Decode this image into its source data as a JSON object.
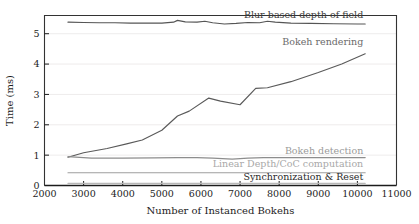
{
  "chart_data": {
    "type": "line",
    "title": "",
    "xlabel": "Number of Instanced Bokehs",
    "ylabel": "Time (ms)",
    "xlim": [
      2000,
      11000
    ],
    "ylim": [
      0,
      5.6
    ],
    "xticks": [
      2000,
      3000,
      4000,
      5000,
      6000,
      7000,
      8000,
      9000,
      10000,
      11000
    ],
    "xtick_labels": [
      "2000",
      "3000",
      "4000",
      "5000",
      "6000",
      "7000",
      "8000",
      "9000",
      "10000",
      "11000"
    ],
    "yticks": [
      0,
      1,
      2,
      3,
      4,
      5
    ],
    "ytick_labels": [
      "0",
      "1",
      "2",
      "3",
      "4",
      "5"
    ],
    "grid": "horizontal-faint",
    "legend_position": "inline-right-of-series",
    "series": [
      {
        "name": "Blur-based depth of field",
        "color": "#555555",
        "label_color": "#3a3a3a",
        "x": [
          2600,
          3000,
          3400,
          3800,
          4200,
          4600,
          5000,
          5300,
          5400,
          5600,
          5900,
          6100,
          6300,
          6600,
          6900,
          7200,
          7500,
          7700,
          7900,
          8300,
          8800,
          9400,
          10000,
          10200
        ],
        "y": [
          5.38,
          5.37,
          5.36,
          5.36,
          5.35,
          5.35,
          5.35,
          5.38,
          5.44,
          5.39,
          5.38,
          5.41,
          5.36,
          5.32,
          5.34,
          5.37,
          5.36,
          5.41,
          5.38,
          5.35,
          5.34,
          5.33,
          5.32,
          5.32
        ]
      },
      {
        "name": "Bokeh rendering",
        "color": "#5a5a5a",
        "label_color": "#6a6a6a",
        "x": [
          2600,
          3000,
          3600,
          4100,
          4500,
          5000,
          5400,
          5700,
          6200,
          6500,
          7000,
          7400,
          7700,
          8300,
          9000,
          9600,
          10200
        ],
        "y": [
          0.93,
          1.08,
          1.22,
          1.37,
          1.5,
          1.82,
          2.29,
          2.45,
          2.88,
          2.78,
          2.66,
          3.2,
          3.22,
          3.42,
          3.72,
          4.0,
          4.34
        ]
      },
      {
        "name": "Bokeh detection",
        "color": "#8d8d8d",
        "label_color": "#9a9a9a",
        "x": [
          2600,
          3200,
          4000,
          4800,
          5400,
          5900,
          6300,
          6800,
          7200,
          7600,
          8200,
          9000,
          9800,
          10200
        ],
        "y": [
          0.95,
          0.9,
          0.9,
          0.91,
          0.92,
          0.92,
          0.9,
          0.87,
          0.9,
          0.92,
          0.92,
          0.92,
          0.92,
          0.92
        ]
      },
      {
        "name": "Linear Depth/CoC computation",
        "color": "#9e9e9e",
        "label_color": "#a8a8a8",
        "x": [
          2600,
          5000,
          7500,
          10200
        ],
        "y": [
          0.42,
          0.42,
          0.42,
          0.42
        ]
      },
      {
        "name": "Synchronization & Reset",
        "color": "#b8b8b8",
        "label_color": "#2a2a2a",
        "x": [
          2600,
          5000,
          7500,
          10200
        ],
        "y": [
          0.07,
          0.07,
          0.07,
          0.07
        ]
      }
    ],
    "series_labels": [
      {
        "text": "Blur-based depth of field",
        "x_data": 10150,
        "y_data": 5.52,
        "anchor": "end",
        "color": "#3a3a3a"
      },
      {
        "text": "Bokeh rendering",
        "x_data": 10150,
        "y_data": 4.62,
        "anchor": "end",
        "color": "#6a6a6a"
      },
      {
        "text": "Bokeh detection",
        "x_data": 10150,
        "y_data": 1.04,
        "anchor": "end",
        "color": "#9a9a9a"
      },
      {
        "text": "Linear Depth/CoC computation",
        "x_data": 10150,
        "y_data": 0.62,
        "anchor": "end",
        "color": "#a8a8a8"
      },
      {
        "text": "Synchronization & Reset",
        "x_data": 10150,
        "y_data": 0.18,
        "anchor": "end",
        "color": "#2a2a2a"
      }
    ]
  }
}
